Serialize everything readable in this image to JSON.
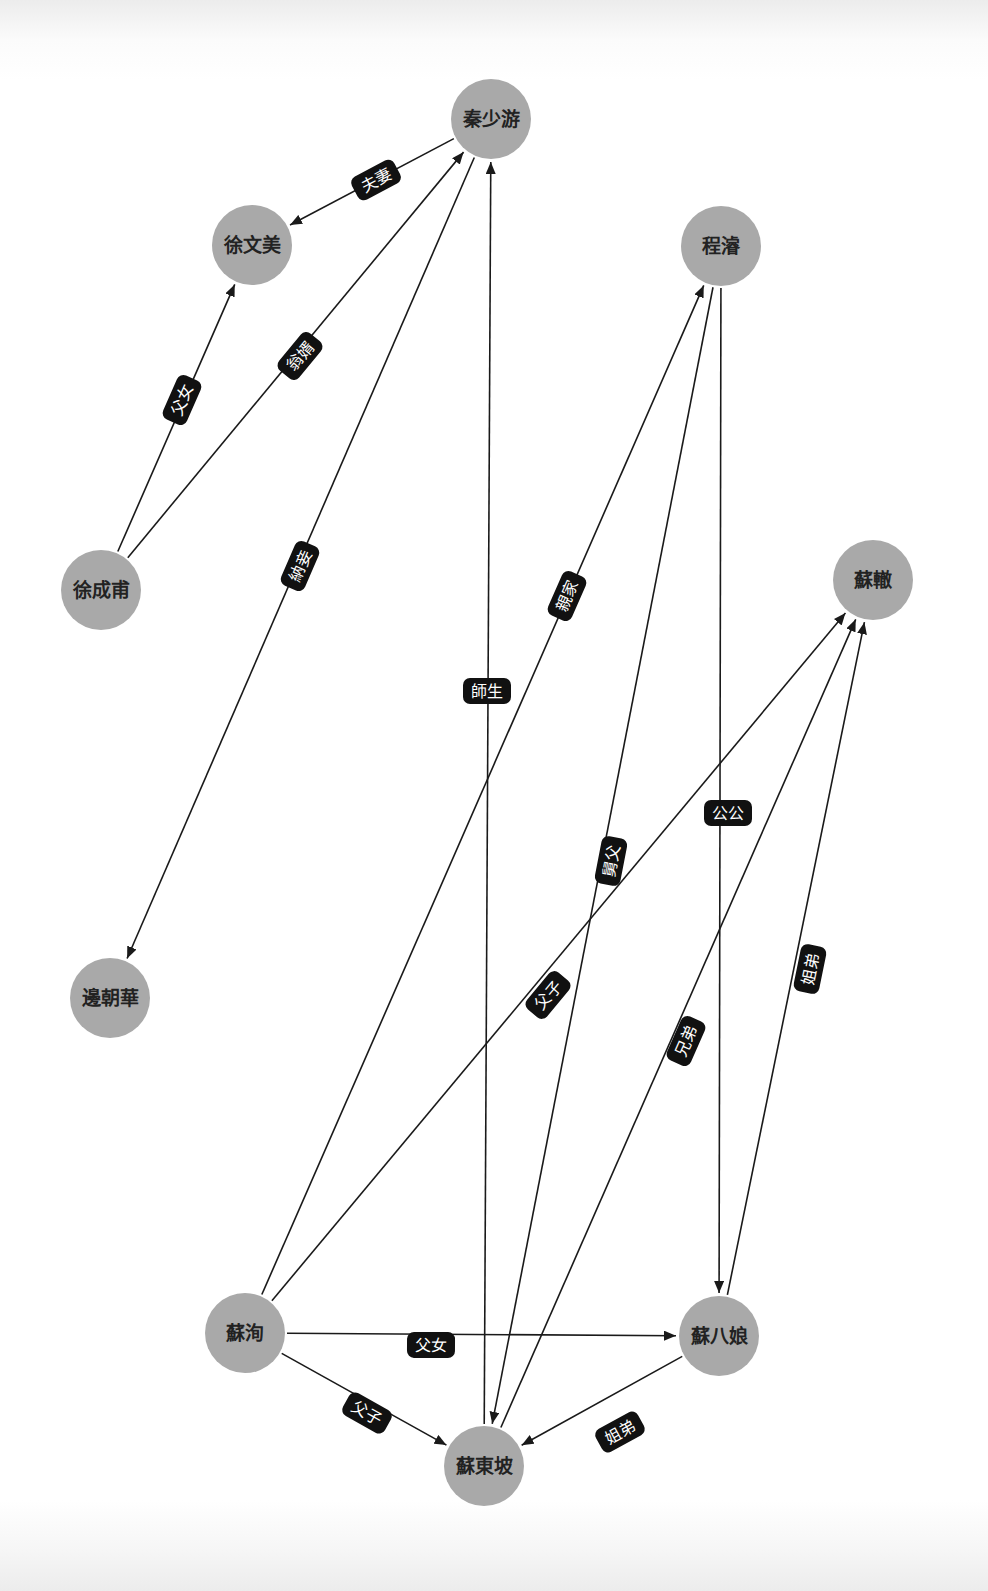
{
  "graph": {
    "title": "",
    "node_radius": 40,
    "colors": {
      "node_fill": "#a9a9a9",
      "node_text": "#222222",
      "edge": "#1a1a1a",
      "edge_label_bg": "#111111",
      "edge_label_text": "#ffffff",
      "background": "#ffffff"
    },
    "nodes": [
      {
        "id": "qin_shaoyou",
        "label": "秦少游",
        "x": 491,
        "y": 119
      },
      {
        "id": "xu_wenmei",
        "label": "徐文美",
        "x": 252,
        "y": 245
      },
      {
        "id": "cheng_jun",
        "label": "程濬",
        "x": 721,
        "y": 246
      },
      {
        "id": "xu_chengfu",
        "label": "徐成甫",
        "x": 101,
        "y": 590
      },
      {
        "id": "su_zhe",
        "label": "蘇轍",
        "x": 873,
        "y": 580
      },
      {
        "id": "bian_chaohua",
        "label": "邊朝華",
        "x": 110,
        "y": 998
      },
      {
        "id": "su_xun",
        "label": "蘇洵",
        "x": 245,
        "y": 1333
      },
      {
        "id": "su_baniang",
        "label": "蘇八娘",
        "x": 719,
        "y": 1336
      },
      {
        "id": "su_dongpo",
        "label": "蘇東坡",
        "x": 484,
        "y": 1466
      }
    ],
    "edges": [
      {
        "from": "qin_shaoyou",
        "to": "xu_wenmei",
        "label": "夫妻",
        "lx": 376,
        "ly": 180
      },
      {
        "from": "xu_chengfu",
        "to": "xu_wenmei",
        "label": "父女",
        "lx": 182,
        "ly": 400
      },
      {
        "from": "xu_chengfu",
        "to": "qin_shaoyou",
        "label": "翁婿",
        "lx": 300,
        "ly": 356
      },
      {
        "from": "qin_shaoyou",
        "to": "bian_chaohua",
        "label": "納妾",
        "lx": 300,
        "ly": 566
      },
      {
        "from": "su_dongpo",
        "to": "qin_shaoyou",
        "label": "師生",
        "lx": 487,
        "ly": 691
      },
      {
        "from": "su_xun",
        "to": "cheng_jun",
        "label": "親家",
        "lx": 567,
        "ly": 596
      },
      {
        "from": "cheng_jun",
        "to": "su_dongpo",
        "label": "舅父",
        "lx": 611,
        "ly": 861
      },
      {
        "from": "cheng_jun",
        "to": "su_baniang",
        "label": "公公",
        "lx": 728,
        "ly": 813
      },
      {
        "from": "su_xun",
        "to": "su_zhe",
        "label": "父子",
        "lx": 548,
        "ly": 995
      },
      {
        "from": "su_dongpo",
        "to": "su_zhe",
        "label": "兄弟",
        "lx": 686,
        "ly": 1041
      },
      {
        "from": "su_baniang",
        "to": "su_zhe",
        "label": "姐弟",
        "lx": 810,
        "ly": 969
      },
      {
        "from": "su_xun",
        "to": "su_baniang",
        "label": "父女",
        "lx": 431,
        "ly": 1345
      },
      {
        "from": "su_xun",
        "to": "su_dongpo",
        "label": "父子",
        "lx": 367,
        "ly": 1413
      },
      {
        "from": "su_baniang",
        "to": "su_dongpo",
        "label": "姐弟",
        "lx": 620,
        "ly": 1432
      }
    ]
  }
}
